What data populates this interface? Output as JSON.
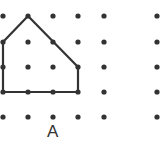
{
  "diagram": {
    "type": "dot-grid-polygon",
    "grid": {
      "columns_x": [
        3,
        28,
        53,
        78,
        104,
        157
      ],
      "rows_y": [
        16,
        42,
        67,
        92,
        117
      ],
      "dot_radius": 2.6,
      "dot_color": "#333333"
    },
    "polygon": {
      "label": "A",
      "vertices": [
        [
          3,
          42
        ],
        [
          28,
          16
        ],
        [
          78,
          67
        ],
        [
          78,
          92
        ],
        [
          3,
          92
        ]
      ],
      "stroke_color": "#333333",
      "stroke_width": 2.2
    },
    "label_position": {
      "x": 47,
      "y": 122
    }
  }
}
